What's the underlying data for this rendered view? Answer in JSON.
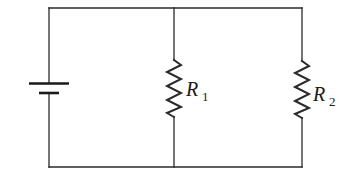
{
  "diagram": {
    "type": "circuit",
    "colors": {
      "wire": "#2a2a2a",
      "background": "#ffffff",
      "text": "#1a1a1a"
    },
    "components": [
      {
        "id": "battery",
        "type": "battery",
        "label": ""
      },
      {
        "id": "R1",
        "type": "resistor",
        "label": "R",
        "subscript": "1"
      },
      {
        "id": "R2",
        "type": "resistor",
        "label": "R",
        "subscript": "2"
      }
    ],
    "labels": {
      "r1_main": "R",
      "r1_sub": "1",
      "r2_main": "R",
      "r2_sub": "2"
    }
  }
}
